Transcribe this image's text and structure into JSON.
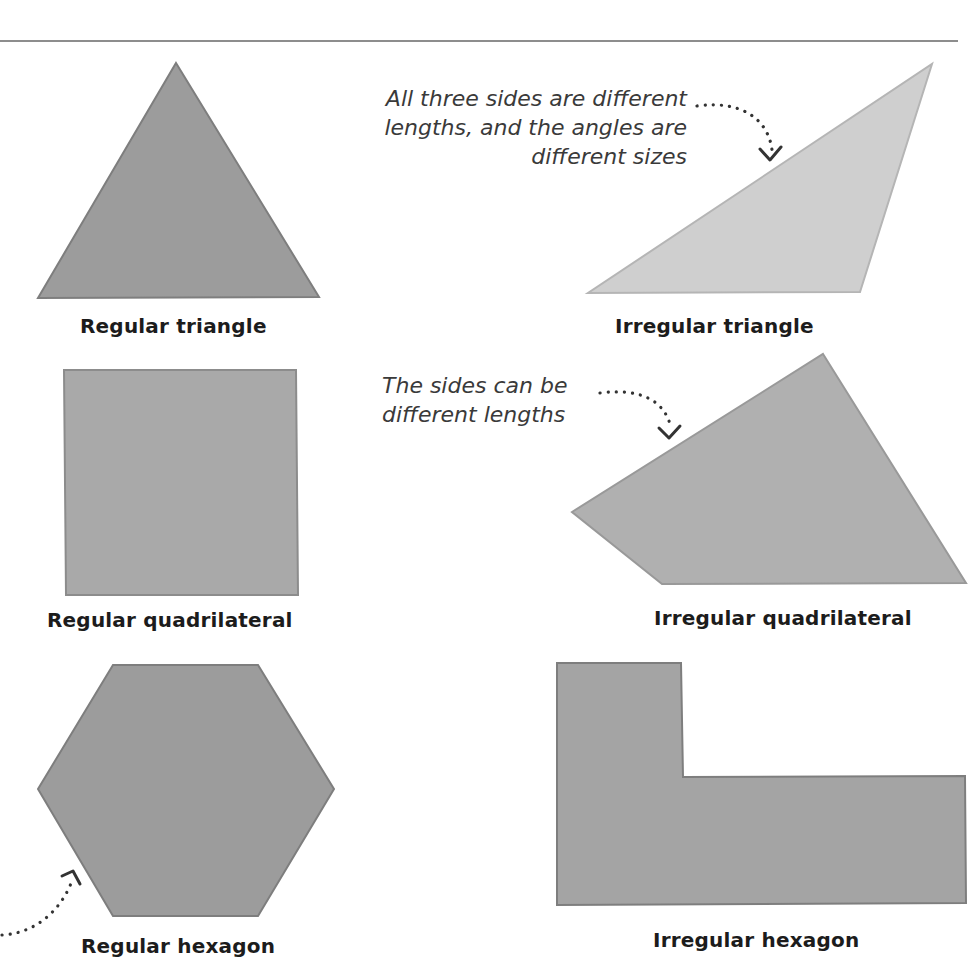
{
  "colors": {
    "dark_fill": "#9c9c9c",
    "dark_stroke": "#7e7e7e",
    "light_fill": "#cfcfcf",
    "light_stroke": "#b5b5b5",
    "mid_fill": "#b0b0b0",
    "mid_stroke": "#999999",
    "text": "#1c1c1c",
    "note_text": "#3a3a3a",
    "rule": "#8d8d8d"
  },
  "shapes": [
    {
      "id": "regular-triangle",
      "label": "Regular triangle",
      "kind": "regular",
      "sides": 3
    },
    {
      "id": "irregular-triangle",
      "label": "Irregular triangle",
      "kind": "irregular",
      "sides": 3
    },
    {
      "id": "regular-quadrilateral",
      "label": "Regular quadrilateral",
      "kind": "regular",
      "sides": 4
    },
    {
      "id": "irregular-quadrilateral",
      "label": "Irregular quadrilateral",
      "kind": "irregular",
      "sides": 4
    },
    {
      "id": "regular-hexagon",
      "label": "Regular hexagon",
      "kind": "regular",
      "sides": 6
    },
    {
      "id": "irregular-hexagon",
      "label": "Irregular hexagon",
      "kind": "irregular",
      "sides": 6
    }
  ],
  "annotations": {
    "irregular_triangle": {
      "lines": [
        "All three sides are different",
        "lengths, and the angles are",
        "different sizes"
      ]
    },
    "irregular_quadrilateral": {
      "lines": [
        "The sides can be",
        "different lengths"
      ]
    }
  }
}
